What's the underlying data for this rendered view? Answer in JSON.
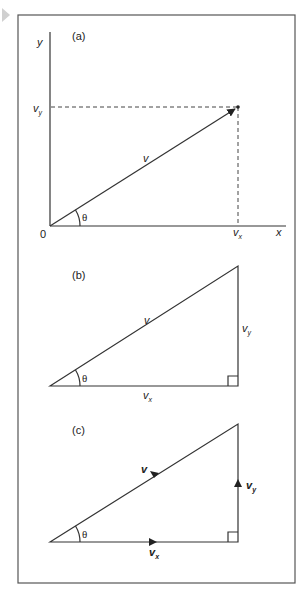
{
  "figure": {
    "panels": [
      {
        "id": "a",
        "label": "(a)",
        "axis_x_label": "x",
        "axis_y_label": "y",
        "origin_label": "0",
        "vector_label": "v",
        "angle_label": "θ",
        "x_component_label": "v",
        "x_component_sub": "x",
        "y_component_label": "v",
        "y_component_sub": "y"
      },
      {
        "id": "b",
        "label": "(b)",
        "hypotenuse_label": "v",
        "angle_label": "θ",
        "base_label": "v",
        "base_sub": "x",
        "side_label": "v",
        "side_sub": "y"
      },
      {
        "id": "c",
        "label": "(c)",
        "hypotenuse_label": "v",
        "angle_label": "θ",
        "base_label": "v",
        "base_sub": "x",
        "side_label": "v",
        "side_sub": "y"
      }
    ],
    "colors": {
      "line": "#333333",
      "frame": "#555555",
      "marker": "#cccccc"
    }
  }
}
